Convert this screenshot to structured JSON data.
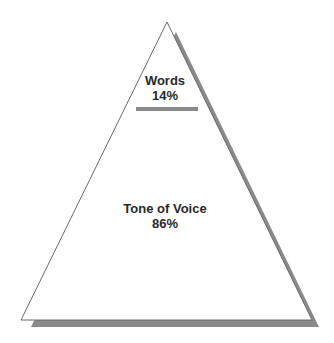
{
  "diagram": {
    "type": "pyramid",
    "colors": {
      "fill": "#ffffff",
      "outline": "#6a6a6a",
      "shadow": "#8a8a8a",
      "divider": "#8a8a8a",
      "text": "#2a2a2a"
    },
    "sections": [
      {
        "name": "Words",
        "percent": "14%"
      },
      {
        "name": "Tone of Voice",
        "percent": "86%"
      }
    ]
  }
}
